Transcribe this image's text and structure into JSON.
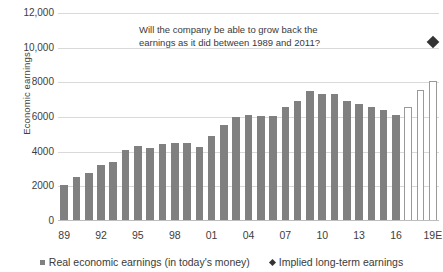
{
  "chart_data": {
    "type": "bar",
    "title": "",
    "xlabel": "",
    "ylabel": "Economic earnings",
    "ylim": [
      0,
      12000
    ],
    "yticks": [
      0,
      2000,
      4000,
      6000,
      8000,
      10000,
      12000
    ],
    "ytick_labels": [
      "0",
      "2000",
      "4000",
      "6000",
      "8000",
      "10,000",
      "12,000"
    ],
    "grid": true,
    "legend_position": "bottom",
    "categories": [
      "89",
      "90",
      "91",
      "92",
      "93",
      "94",
      "95",
      "96",
      "97",
      "98",
      "99",
      "00",
      "01",
      "02",
      "03",
      "04",
      "05",
      "06",
      "07",
      "08",
      "09",
      "10",
      "11",
      "12",
      "13",
      "14",
      "15",
      "16",
      "17E",
      "18E",
      "19E"
    ],
    "xtick_labels": [
      "89",
      "92",
      "95",
      "98",
      "01",
      "04",
      "07",
      "10",
      "13",
      "16",
      "19E"
    ],
    "xtick_indices": [
      0,
      3,
      6,
      9,
      12,
      15,
      18,
      21,
      24,
      27,
      30
    ],
    "series": [
      {
        "name": "Real economic earnings (in today's money)",
        "type": "bar",
        "color": "#808080",
        "values": [
          2080,
          2560,
          2750,
          3230,
          3400,
          4080,
          4330,
          4200,
          4450,
          4490,
          4490,
          4260,
          4900,
          5520,
          6000,
          6100,
          6080,
          6080,
          6560,
          6900,
          7500,
          7320,
          7300,
          6900,
          6750,
          6600,
          6400,
          6120,
          null,
          null,
          null
        ]
      },
      {
        "name": "Real economic earnings (in today's money) — estimates",
        "type": "bar",
        "color": "#ffffff",
        "style": "outline",
        "values": [
          null,
          null,
          null,
          null,
          null,
          null,
          null,
          null,
          null,
          null,
          null,
          null,
          null,
          null,
          null,
          null,
          null,
          null,
          null,
          null,
          null,
          null,
          null,
          null,
          null,
          null,
          null,
          null,
          6600,
          7560,
          8100
        ]
      },
      {
        "name": "Implied long-term earnings",
        "type": "scatter",
        "marker": "diamond",
        "color": "#333333",
        "points": [
          {
            "x_index": 30,
            "y": 10300
          }
        ]
      }
    ],
    "annotations": [
      {
        "name": "growth-question",
        "line1": "Will the company be able to grow back the",
        "line2": "earnings as it did between 1989 and 2011?"
      }
    ]
  },
  "legend": {
    "items": [
      {
        "label": "Real economic earnings (in today's money)",
        "marker": "square",
        "color": "#808080"
      },
      {
        "label": "Implied long-term earnings",
        "marker": "diamond",
        "color": "#333333"
      }
    ]
  },
  "colors": {
    "bar": "#808080",
    "estimate_border": "#9a9a9a",
    "marker": "#333333",
    "gridline": "#d9d9d9",
    "text": "#3a3a3a",
    "background": "#ffffff"
  }
}
